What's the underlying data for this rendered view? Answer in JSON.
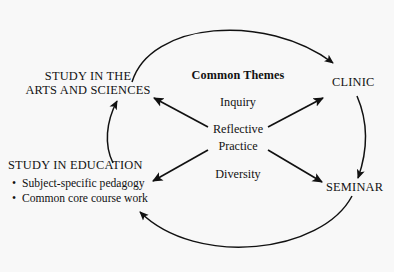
{
  "diagram": {
    "background_color": "#f8f8f8",
    "stroke_color": "#111111",
    "center": {
      "heading": "Common Themes",
      "themes": [
        {
          "id": "inquiry",
          "label": "Inquiry"
        },
        {
          "id": "reflective",
          "label": "Reflective"
        },
        {
          "id": "practice",
          "label": "Practice"
        },
        {
          "id": "diversity",
          "label": "Diversity"
        }
      ]
    },
    "nodes": [
      {
        "id": "arts-and-sciences",
        "lines": [
          "STUDY IN THE",
          "ARTS AND SCIENCES"
        ],
        "line1": "STUDY IN THE",
        "line2": "ARTS AND SCIENCES"
      },
      {
        "id": "clinic",
        "label": "CLINIC"
      },
      {
        "id": "seminar",
        "label": "SEMINAR"
      },
      {
        "id": "study-in-education",
        "label": "STUDY IN EDUCATION",
        "bullet_char": "•",
        "bullets": [
          "Subject-specific pedagogy",
          "Common core course work"
        ]
      }
    ],
    "connections": [
      {
        "id": "arc-arts-to-clinic",
        "from": "arts-and-sciences",
        "to": "clinic",
        "style": "curved-arc-top"
      },
      {
        "id": "arc-clinic-to-seminar",
        "from": "clinic",
        "to": "seminar",
        "style": "curved-arc-right"
      },
      {
        "id": "arc-seminar-to-education",
        "from": "seminar",
        "to": "study-in-education",
        "style": "curved-arc-bottom"
      },
      {
        "id": "arc-education-to-arts",
        "from": "study-in-education",
        "to": "arts-and-sciences",
        "style": "curved-arc-left"
      },
      {
        "id": "spoke-center-to-arts",
        "from": "reflective-practice",
        "to": "arts-and-sciences",
        "style": "straight"
      },
      {
        "id": "spoke-center-to-clinic",
        "from": "reflective-practice",
        "to": "clinic",
        "style": "straight"
      },
      {
        "id": "spoke-center-to-education",
        "from": "reflective-practice",
        "to": "study-in-education",
        "style": "straight"
      },
      {
        "id": "spoke-center-to-seminar",
        "from": "reflective-practice",
        "to": "seminar",
        "style": "straight"
      }
    ]
  }
}
